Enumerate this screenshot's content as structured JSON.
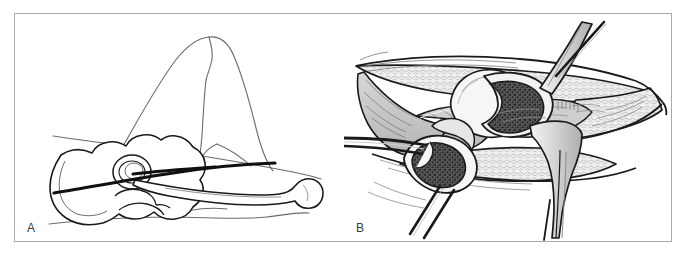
{
  "figure": {
    "kind": "medical-surgical-line-illustration",
    "panel_count": 2,
    "frame_color": "#a9a9ad",
    "background_color": "#ffffff",
    "ink_color": "#1a1a1a",
    "thin_line_color": "#5a5a5a",
    "muscle_fill": "#c9c9c9",
    "bone_fill": "#f2f2f2",
    "marrow_fill": "#4a4a4a",
    "fat_fill": "#ededed"
  },
  "panels": [
    {
      "id": "a",
      "label": "A",
      "caption_text": "A",
      "content_name": "lateral-patient-position-with-incision-line",
      "elements": [
        {
          "name": "flexed-leg-outline",
          "role": "patient-limb"
        },
        {
          "name": "body-contour-outline",
          "role": "patient-trunk"
        },
        {
          "name": "pelvis-bone-outline",
          "role": "skeleton"
        },
        {
          "name": "acetabulum-outline",
          "role": "skeleton"
        },
        {
          "name": "femur-bone-outline",
          "role": "skeleton"
        },
        {
          "name": "skin-incision-line",
          "role": "surgical-marking"
        }
      ]
    },
    {
      "id": "b",
      "label": "B",
      "caption_text": "B",
      "content_name": "intraoperative-exposure-with-retractors",
      "elements": [
        {
          "name": "wound-edge-outline",
          "role": "soft-tissue"
        },
        {
          "name": "subcutaneous-fat-layer",
          "role": "soft-tissue"
        },
        {
          "name": "muscle-belly-group",
          "role": "soft-tissue"
        },
        {
          "name": "femoral-head-bone",
          "role": "skeleton"
        },
        {
          "name": "femoral-neck-cut-surface",
          "role": "osteotomy"
        },
        {
          "name": "proximal-femur-cut-surface",
          "role": "osteotomy"
        },
        {
          "name": "cancellous-marrow-texture",
          "role": "osteotomy"
        },
        {
          "name": "retractor-blade-right",
          "role": "instrument"
        },
        {
          "name": "retractor-handle-upper",
          "role": "instrument"
        },
        {
          "name": "retractor-handle-upper-right",
          "role": "instrument"
        },
        {
          "name": "retractor-handle-lower-left",
          "role": "instrument"
        },
        {
          "name": "retractor-handle-lower-right",
          "role": "instrument"
        },
        {
          "name": "bone-hook-left",
          "role": "instrument"
        }
      ]
    }
  ]
}
